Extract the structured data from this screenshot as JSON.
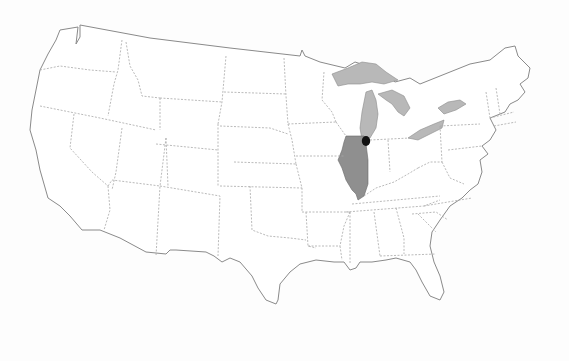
{
  "map": {
    "title": "",
    "region": "Contiguous United States",
    "style": "grayscale outline map with dashed state borders",
    "highlighted_state": {
      "name": "Illinois",
      "color": "#8f8f8f"
    },
    "highlighted_feature": {
      "name": "Great Lakes",
      "color": "#b8b8b8"
    },
    "marker": {
      "name": "Chicago",
      "type": "filled-dot",
      "color": "#111111"
    },
    "colors": {
      "background": "#fdfdfd",
      "land": "#ffffff",
      "outline": "#8a8a8a",
      "state_border": "#a8a8a8"
    }
  }
}
